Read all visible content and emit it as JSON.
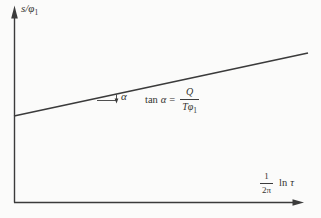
{
  "figure": {
    "background": "#fbfbfa",
    "ink": "#3b3b3b",
    "y_axis": {
      "label_main": "s/φ",
      "label_sub": "1"
    },
    "x_axis": {
      "frac_num": "1",
      "frac_den": "2π",
      "fn": "ln",
      "var": "τ"
    },
    "angle": {
      "label": "α"
    },
    "formula": {
      "fn": "tan",
      "var": "α",
      "eq": "=",
      "num": "Q",
      "den_main": "Tφ",
      "den_sub": "1"
    }
  }
}
